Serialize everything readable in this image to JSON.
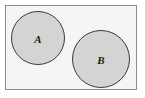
{
  "figure": {
    "type": "venn-diagram",
    "width": 145,
    "height": 98,
    "background_color": "#ffffff"
  },
  "universe": {
    "name": "universal-set-rectangle",
    "x": 5.5,
    "y": 5.5,
    "width": 131,
    "height": 84,
    "fill_color": "#f6f5f3",
    "stroke_color": "#8c8c8c",
    "stroke_width": 1
  },
  "sets": [
    {
      "id": "A",
      "label": "A",
      "cx": 38,
      "cy": 38,
      "r": 26.5,
      "fill_color": "#d4d4d2",
      "stroke_color": "#3a3a3a",
      "stroke_width": 1,
      "label_x": 38,
      "label_y": 39
    },
    {
      "id": "B",
      "label": "B",
      "cx": 101,
      "cy": 59,
      "r": 28.5,
      "fill_color": "#d4d4d2",
      "stroke_color": "#3a3a3a",
      "stroke_width": 1,
      "label_x": 101,
      "label_y": 60
    }
  ],
  "relation": {
    "overlapping": false,
    "note": "disjoint"
  }
}
